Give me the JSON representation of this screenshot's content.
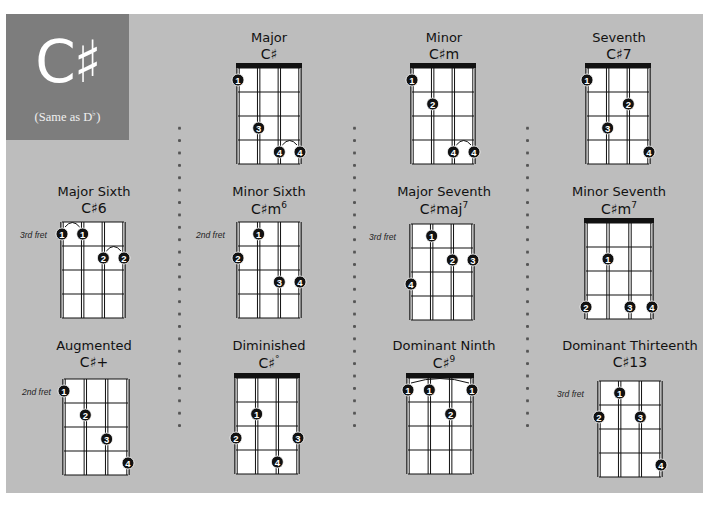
{
  "title": {
    "note": "C♯",
    "subtitle_prefix": "(Same as D",
    "subtitle_flat": "♭",
    "subtitle_suffix": ")"
  },
  "colors": {
    "panel": "#bdbdbd",
    "title_box": "#7d7d7d",
    "fretboard": "#ffffff",
    "lines": "#111111",
    "dots": "#111111"
  },
  "chords": [
    {
      "name": "Major",
      "symbol_base": "C♯",
      "symbol_sup": "",
      "fret_label": "",
      "nut": true,
      "dots": [
        {
          "string": 1,
          "fret": 1,
          "finger": "1"
        },
        {
          "string": 2,
          "fret": 3,
          "finger": "3"
        },
        {
          "string": 3,
          "fret": 4,
          "finger": "4"
        },
        {
          "string": 4,
          "fret": 4,
          "finger": "4"
        }
      ],
      "barre_arcs": [
        [
          3,
          4,
          4
        ]
      ]
    },
    {
      "name": "Minor",
      "symbol_base": "C♯m",
      "symbol_sup": "",
      "fret_label": "",
      "nut": true,
      "dots": [
        {
          "string": 1,
          "fret": 1,
          "finger": "1"
        },
        {
          "string": 2,
          "fret": 2,
          "finger": "2"
        },
        {
          "string": 3,
          "fret": 4,
          "finger": "4"
        },
        {
          "string": 4,
          "fret": 4,
          "finger": "4"
        }
      ],
      "barre_arcs": [
        [
          3,
          4,
          4
        ]
      ]
    },
    {
      "name": "Seventh",
      "symbol_base": "C♯7",
      "symbol_sup": "",
      "fret_label": "",
      "nut": true,
      "dots": [
        {
          "string": 1,
          "fret": 1,
          "finger": "1"
        },
        {
          "string": 3,
          "fret": 2,
          "finger": "2"
        },
        {
          "string": 2,
          "fret": 3,
          "finger": "3"
        },
        {
          "string": 4,
          "fret": 4,
          "finger": "4"
        }
      ],
      "barre_arcs": []
    },
    {
      "name": "Major Sixth",
      "symbol_base": "C♯6",
      "symbol_sup": "",
      "fret_label": "3rd fret",
      "nut": false,
      "dots": [
        {
          "string": 1,
          "fret": 1,
          "finger": "1"
        },
        {
          "string": 2,
          "fret": 1,
          "finger": "1"
        },
        {
          "string": 3,
          "fret": 2,
          "finger": "2"
        },
        {
          "string": 4,
          "fret": 2,
          "finger": "2"
        }
      ],
      "barre_arcs": [
        [
          1,
          2,
          1
        ],
        [
          3,
          4,
          2
        ]
      ]
    },
    {
      "name": "Minor Sixth",
      "symbol_base": "C♯m",
      "symbol_sup": "6",
      "fret_label": "2nd fret",
      "nut": false,
      "dots": [
        {
          "string": 2,
          "fret": 1,
          "finger": "1"
        },
        {
          "string": 1,
          "fret": 2,
          "finger": "2"
        },
        {
          "string": 3,
          "fret": 3,
          "finger": "3"
        },
        {
          "string": 4,
          "fret": 3,
          "finger": "4"
        }
      ],
      "barre_arcs": []
    },
    {
      "name": "Major Seventh",
      "symbol_base": "C♯maj",
      "symbol_sup": "7",
      "fret_label": "3rd fret",
      "nut": false,
      "dots": [
        {
          "string": 2,
          "fret": 1,
          "finger": "1"
        },
        {
          "string": 3,
          "fret": 2,
          "finger": "2"
        },
        {
          "string": 4,
          "fret": 2,
          "finger": "3"
        },
        {
          "string": 1,
          "fret": 3,
          "finger": "4"
        }
      ],
      "barre_arcs": []
    },
    {
      "name": "Minor Seventh",
      "symbol_base": "C♯m",
      "symbol_sup": "7",
      "fret_label": "",
      "nut": true,
      "dots": [
        {
          "string": 2,
          "fret": 2,
          "finger": "1"
        },
        {
          "string": 1,
          "fret": 4,
          "finger": "2"
        },
        {
          "string": 3,
          "fret": 4,
          "finger": "3"
        },
        {
          "string": 4,
          "fret": 4,
          "finger": "4"
        }
      ],
      "barre_arcs": []
    },
    {
      "name": "Augmented",
      "symbol_base": "C♯+",
      "symbol_sup": "",
      "fret_label": "2nd fret",
      "nut": false,
      "dots": [
        {
          "string": 1,
          "fret": 1,
          "finger": "1"
        },
        {
          "string": 2,
          "fret": 2,
          "finger": "2"
        },
        {
          "string": 3,
          "fret": 3,
          "finger": "3"
        },
        {
          "string": 4,
          "fret": 4,
          "finger": "4"
        }
      ],
      "barre_arcs": []
    },
    {
      "name": "Diminished",
      "symbol_base": "C♯",
      "symbol_sup": "°",
      "fret_label": "",
      "nut": true,
      "dots": [
        {
          "string": 2,
          "fret": 2,
          "finger": "1"
        },
        {
          "string": 1,
          "fret": 3,
          "finger": "2"
        },
        {
          "string": 4,
          "fret": 3,
          "finger": "3"
        },
        {
          "string": 3,
          "fret": 4,
          "finger": "4"
        }
      ],
      "barre_arcs": []
    },
    {
      "name": "Dominant Ninth",
      "symbol_base": "C♯",
      "symbol_sup": "9",
      "fret_label": "",
      "nut": true,
      "dots": [
        {
          "string": 1,
          "fret": 1,
          "finger": "1"
        },
        {
          "string": 2,
          "fret": 1,
          "finger": "1"
        },
        {
          "string": 4,
          "fret": 1,
          "finger": "1"
        },
        {
          "string": 3,
          "fret": 2,
          "finger": "2"
        }
      ],
      "barre_arcs": [
        [
          1,
          4,
          1
        ]
      ]
    },
    {
      "name": "Dominant Thirteenth",
      "symbol_base": "C♯13",
      "symbol_sup": "",
      "fret_label": "3rd fret",
      "nut": false,
      "dots": [
        {
          "string": 2,
          "fret": 1,
          "finger": "1"
        },
        {
          "string": 1,
          "fret": 2,
          "finger": "2"
        },
        {
          "string": 3,
          "fret": 2,
          "finger": "3"
        },
        {
          "string": 4,
          "fret": 4,
          "finger": "4"
        }
      ],
      "barre_arcs": []
    }
  ]
}
